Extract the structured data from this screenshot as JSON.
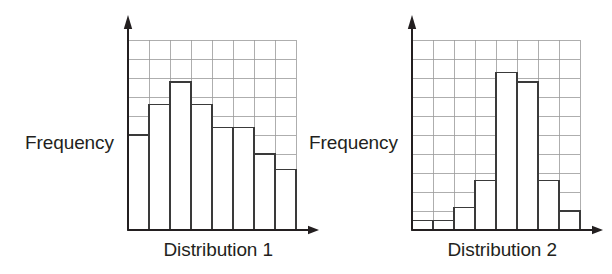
{
  "figure": {
    "background_color": "#ffffff",
    "ink_color": "#231f20",
    "grid_color": "#9a9a9a",
    "bar_stroke_color": "#3a3a3a",
    "bar_fill_color": "#ffffff"
  },
  "panels": [
    {
      "id": "left",
      "y_axis_label": "Frequency",
      "x_axis_label": "Distribution 1"
    },
    {
      "id": "right",
      "y_axis_label": "Frequency",
      "x_axis_label": "Distribution 2"
    }
  ],
  "chart_data": [
    {
      "type": "bar",
      "title": "",
      "xlabel": "Distribution 1",
      "ylabel": "Frequency",
      "categories": [
        "1",
        "2",
        "3",
        "4",
        "5",
        "6",
        "7",
        "8"
      ],
      "values": [
        5.0,
        6.6,
        7.8,
        6.6,
        5.4,
        5.4,
        4.0,
        3.2
      ],
      "ylim": [
        0,
        10
      ],
      "xlim": [
        0,
        8
      ],
      "grid": true,
      "grid_rows": 10,
      "grid_cols": 8,
      "tick_labels_x": [],
      "tick_labels_y": [],
      "legend": "none",
      "annotations": [],
      "shape_description": "roughly uniform / slightly right-skewed, low spread in heights"
    },
    {
      "type": "bar",
      "title": "",
      "xlabel": "Distribution 2",
      "ylabel": "Frequency",
      "categories": [
        "1",
        "2",
        "3",
        "4",
        "5",
        "6",
        "7",
        "8"
      ],
      "values": [
        0.5,
        0.5,
        1.2,
        2.6,
        8.3,
        7.8,
        2.6,
        1.0
      ],
      "ylim": [
        0,
        10
      ],
      "xlim": [
        0,
        8
      ],
      "grid": true,
      "grid_rows": 10,
      "grid_cols": 8,
      "tick_labels_x": [],
      "tick_labels_y": [],
      "legend": "none",
      "annotations": [],
      "shape_description": "symmetric bell-shaped / peaked in the centre, large spread in heights"
    }
  ]
}
